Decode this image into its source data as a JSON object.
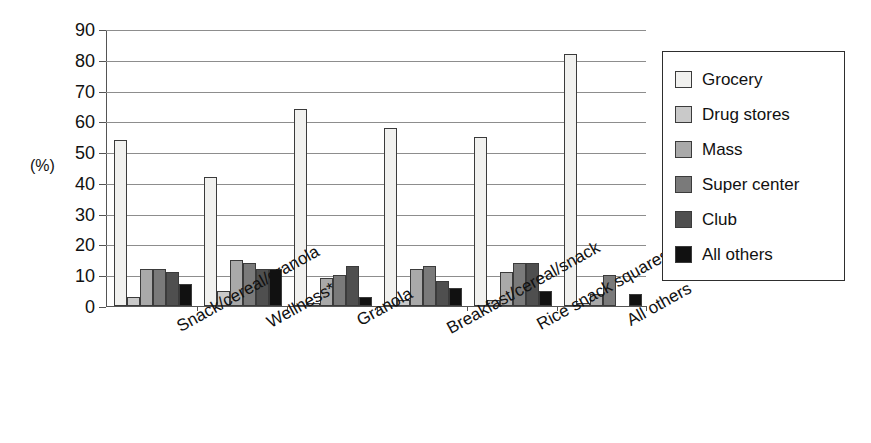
{
  "chart_data": {
    "type": "bar",
    "title": "",
    "xlabel": "",
    "ylabel": "(%)",
    "ylim": [
      0,
      90
    ],
    "ytick_step": 10,
    "yticks": [
      90,
      80,
      70,
      60,
      50,
      40,
      30,
      20,
      10,
      0
    ],
    "grid": true,
    "legend_position": "right",
    "categories": [
      "Snack/cereal/granola",
      "Wellness*",
      "Granola",
      "Breakfast/cereal/snack",
      "Rice snack squares",
      "All others"
    ],
    "series": [
      {
        "name": "Grocery",
        "color": "#f1f1ef",
        "values": [
          54,
          42,
          64,
          58,
          55,
          82
        ]
      },
      {
        "name": "Drug stores",
        "color": "#c9c9c9",
        "values": [
          3,
          5,
          1,
          2,
          2,
          1
        ]
      },
      {
        "name": "Mass",
        "color": "#a9a9a9",
        "values": [
          12,
          15,
          9,
          12,
          11,
          4
        ]
      },
      {
        "name": "Super center",
        "color": "#7a7a7a",
        "values": [
          12,
          14,
          10,
          13,
          14,
          10
        ]
      },
      {
        "name": "Club",
        "color": "#4f4f4f",
        "values": [
          11,
          12,
          13,
          8,
          14,
          0
        ]
      },
      {
        "name": "All others",
        "color": "#111111",
        "values": [
          7,
          12,
          3,
          6,
          5,
          4
        ]
      }
    ],
    "footnote": "*"
  },
  "legend": {
    "items": [
      {
        "label": "Grocery",
        "color": "#f1f1ef"
      },
      {
        "label": "Drug stores",
        "color": "#c9c9c9"
      },
      {
        "label": "Mass",
        "color": "#a9a9a9"
      },
      {
        "label": "Super center",
        "color": "#7a7a7a"
      },
      {
        "label": "Club",
        "color": "#4f4f4f"
      },
      {
        "label": "All others",
        "color": "#111111"
      }
    ]
  },
  "axis": {
    "unit_label": "(%)"
  }
}
